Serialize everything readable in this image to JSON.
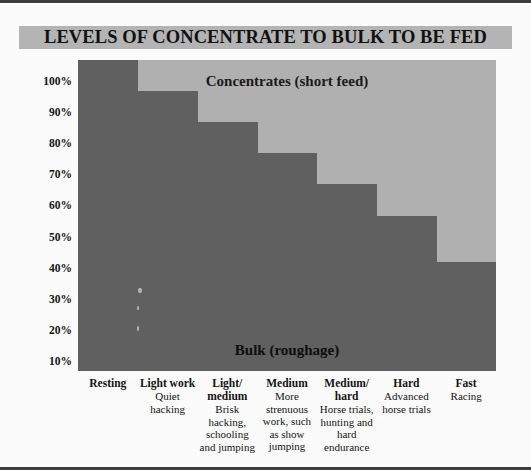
{
  "figure": {
    "title": "LEVELS OF CONCENTRATE TO BULK TO BE FED",
    "title_band_color": "#b4b4b4",
    "background_color": "#fbfbfb"
  },
  "legend_labels": {
    "top": "Concentrates (short feed)",
    "bottom": "Bulk (roughage)"
  },
  "colors": {
    "bulk": "#606060",
    "concentrates": "#b0b0b0",
    "text": "#131313"
  },
  "y_axis": {
    "ticks": [
      "100%",
      "90%",
      "80%",
      "70%",
      "60%",
      "50%",
      "40%",
      "30%",
      "20%",
      "10%"
    ],
    "values": [
      100,
      90,
      80,
      70,
      60,
      50,
      40,
      30,
      20,
      10
    ]
  },
  "x_axis": {
    "categories": [
      {
        "title": "Resting",
        "desc": ""
      },
      {
        "title": "Light work",
        "desc": "Quiet\nhacking"
      },
      {
        "title": "Light/\nmedium",
        "desc": "Brisk\nhacking,\nschooling\nand jumping"
      },
      {
        "title": "Medium",
        "desc": "More\nstrenuous\nwork, such\nas show\njumping"
      },
      {
        "title": "Medium/\nhard",
        "desc": "Horse trials,\nhunting and\nhard\nendurance"
      },
      {
        "title": "Hard",
        "desc": "Advanced\nhorse trials"
      },
      {
        "title": "Fast",
        "desc": "Racing"
      }
    ]
  },
  "chart_data": {
    "type": "bar",
    "title": "LEVELS OF CONCENTRATE TO BULK TO BE FED",
    "xlabel": "",
    "ylabel": "",
    "ylim": [
      0,
      100
    ],
    "grid": false,
    "legend_position": "in-plot",
    "stacked": true,
    "categories": [
      "Resting",
      "Light work",
      "Light/medium",
      "Medium",
      "Medium/hard",
      "Hard",
      "Fast"
    ],
    "series": [
      {
        "name": "Bulk (roughage)",
        "values": [
          100,
          90,
          80,
          70,
          60,
          50,
          35
        ]
      },
      {
        "name": "Concentrates (short feed)",
        "values": [
          0,
          10,
          20,
          30,
          40,
          50,
          65
        ]
      }
    ],
    "annotations": [
      "Concentrates (short feed)",
      "Bulk (roughage)"
    ]
  }
}
